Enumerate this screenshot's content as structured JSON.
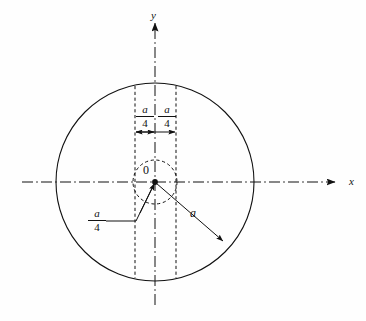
{
  "figure": {
    "type": "engineering-diagram",
    "background_color": "#fefefe",
    "line_color": "#111111",
    "axes": {
      "x_label": "x",
      "y_label": "y",
      "origin_label": "0",
      "x_axis_style": "dash-dot centerline",
      "y_axis_style": "dash-dot centerline"
    },
    "labels": {
      "dim_left_numerator": "a",
      "dim_left_denominator": "4",
      "dim_right_numerator": "a",
      "dim_right_denominator": "4",
      "leader_inner_numerator": "a",
      "leader_inner_denominator": "4",
      "radius_label": "a"
    },
    "geometry": {
      "outer_circle_center_x": 155,
      "outer_circle_center_y": 182,
      "outer_circle_radius": 99,
      "inner_circle_radius": 22,
      "strip_left_x": 135,
      "strip_right_x": 176,
      "dimension_arrow_y": 132
    },
    "icons": {
      "x_arrow": "arrow-right-icon",
      "y_arrow": "arrow-up-icon",
      "dim_arrows": "double-arrow-icon",
      "radius_arrow": "arrow-head-icon"
    }
  }
}
